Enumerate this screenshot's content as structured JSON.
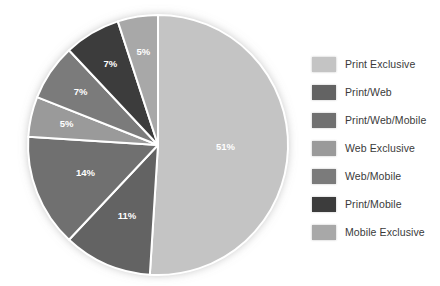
{
  "chart_data": {
    "type": "pie",
    "title": "",
    "subtitle": "",
    "xlabel": "",
    "ylabel": "",
    "legend_position": "right",
    "grid": false,
    "units": "percent",
    "start_angle_deg": 0,
    "direction": "clockwise",
    "total": 100,
    "categories": [
      "Print Exclusive",
      "Print/Web",
      "Print/Web/Mobile",
      "Web Exclusive",
      "Web/Mobile",
      "Print/Mobile",
      "Mobile Exclusive"
    ],
    "values": [
      51,
      11,
      14,
      5,
      7,
      7,
      5
    ],
    "data_labels": [
      "51%",
      "11%",
      "14%",
      "5%",
      "7%",
      "7%",
      "5%"
    ],
    "colors": [
      "#c4c4c4",
      "#636363",
      "#707070",
      "#9a9a9a",
      "#7b7b7b",
      "#3c3c3c",
      "#a8a8a8"
    ],
    "slices": [
      {
        "label": "Print Exclusive",
        "value": 51,
        "data_label": "51%",
        "color": "#c4c4c4"
      },
      {
        "label": "Print/Web",
        "value": 11,
        "data_label": "11%",
        "color": "#636363"
      },
      {
        "label": "Print/Web/Mobile",
        "value": 14,
        "data_label": "14%",
        "color": "#707070"
      },
      {
        "label": "Web Exclusive",
        "value": 5,
        "data_label": "5%",
        "color": "#9a9a9a"
      },
      {
        "label": "Web/Mobile",
        "value": 7,
        "data_label": "7%",
        "color": "#7b7b7b"
      },
      {
        "label": "Print/Mobile",
        "value": 7,
        "data_label": "7%",
        "color": "#3c3c3c"
      },
      {
        "label": "Mobile Exclusive",
        "value": 5,
        "data_label": "5%",
        "color": "#a8a8a8"
      }
    ]
  },
  "legend": {
    "items": [
      {
        "label": "Print Exclusive",
        "color": "#c4c4c4"
      },
      {
        "label": "Print/Web",
        "color": "#636363"
      },
      {
        "label": "Print/Web/Mobile",
        "color": "#707070"
      },
      {
        "label": "Web Exclusive",
        "color": "#9a9a9a"
      },
      {
        "label": "Web/Mobile",
        "color": "#7b7b7b"
      },
      {
        "label": "Print/Mobile",
        "color": "#3c3c3c"
      },
      {
        "label": "Mobile Exclusive",
        "color": "#a8a8a8"
      }
    ]
  },
  "style": {
    "separator_color": "#ffffff",
    "label_text_color": "#ffffff",
    "background": "#ffffff"
  }
}
